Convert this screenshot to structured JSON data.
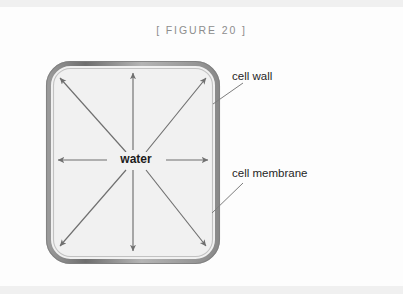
{
  "figure": {
    "title": "[ FIGURE 20 ]",
    "caption_color": "#8d8d8d"
  },
  "diagram": {
    "type": "cell-osmosis-diagram",
    "center_label": "water",
    "cell_fill_color": "#f1f1f1",
    "cell_wall_color": "#7a7a7a",
    "cell_membrane_color": "#b9b9b9",
    "arrow_color": "#6f6f6f",
    "arrow_count": 8,
    "arrow_directions": [
      "north",
      "north-east",
      "east",
      "south-east",
      "south",
      "south-west",
      "west",
      "north-west"
    ],
    "callouts": [
      {
        "label": "cell wall",
        "points_to": "outer-boundary"
      },
      {
        "label": "cell membrane",
        "points_to": "inner-boundary"
      }
    ]
  }
}
